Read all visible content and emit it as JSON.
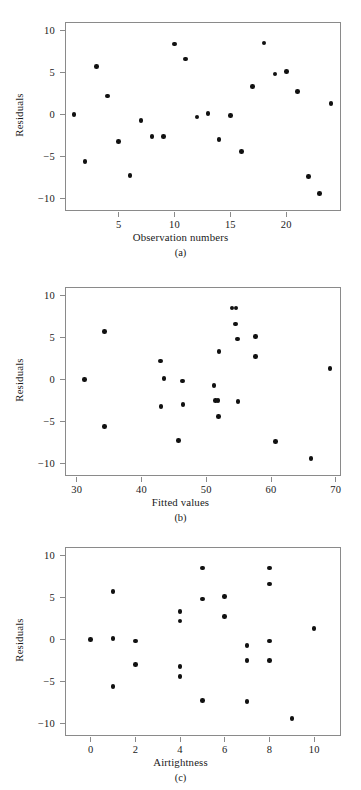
{
  "figure": {
    "ylabel": "Residuals",
    "yticks": [
      "10",
      "5",
      "0",
      "-5",
      "-10"
    ],
    "ytick_values": [
      10,
      5,
      0,
      -5,
      -10
    ],
    "ylim": [
      -11.5,
      11.0
    ]
  },
  "chart_data": [
    {
      "type": "scatter",
      "panel": "(a)",
      "title": "",
      "xlabel": "Observation numbers",
      "ylabel": "Residuals",
      "xticks": [
        "5",
        "10",
        "15",
        "20"
      ],
      "xtick_values": [
        5,
        10,
        15,
        20
      ],
      "xlim": [
        0.2,
        24.9
      ],
      "ylim": [
        -11.5,
        11.0
      ],
      "grid": false,
      "legend": "none",
      "x": [
        1,
        2,
        3,
        4,
        5,
        6,
        7,
        8,
        9,
        10,
        11,
        12,
        13,
        14,
        15,
        16,
        17,
        18,
        19,
        20,
        21,
        22,
        23,
        24
      ],
      "y": [
        0.0,
        -5.6,
        5.7,
        2.2,
        -3.2,
        -7.3,
        -0.7,
        -2.6,
        -2.6,
        8.4,
        6.6,
        -0.3,
        0.1,
        -3.0,
        -0.1,
        -4.4,
        3.3,
        8.5,
        4.8,
        5.1,
        2.7,
        -7.4,
        -9.4,
        1.3
      ]
    },
    {
      "type": "scatter",
      "panel": "(b)",
      "title": "",
      "xlabel": "Fitted values",
      "ylabel": "Residuals",
      "xticks": [
        "30",
        "40",
        "50",
        "60",
        "70"
      ],
      "xtick_values": [
        30,
        40,
        50,
        60,
        70
      ],
      "xlim": [
        28.2,
        70.8
      ],
      "ylim": [
        -11.5,
        11.0
      ],
      "grid": false,
      "legend": "none",
      "x": [
        31.2,
        34.3,
        34.3,
        42.9,
        43.5,
        45.7,
        43.0,
        46.3,
        46.4,
        54.0,
        54.6,
        51.2,
        51.4,
        51.9,
        54.5,
        52.0,
        51.8,
        54.8,
        54.9,
        57.6,
        57.6,
        60.7,
        66.2,
        69.1
      ],
      "y": [
        0.0,
        -5.6,
        5.7,
        2.2,
        0.1,
        -7.3,
        -3.2,
        -0.2,
        -3.0,
        8.5,
        8.5,
        -0.7,
        -2.5,
        -4.4,
        6.6,
        3.3,
        -2.5,
        4.8,
        -2.6,
        5.1,
        2.7,
        -7.4,
        -9.4,
        1.3
      ]
    },
    {
      "type": "scatter",
      "panel": "(c)",
      "title": "",
      "xlabel": "Airtightness",
      "ylabel": "Residuals",
      "xticks": [
        "0",
        "2",
        "4",
        "6",
        "8",
        "10"
      ],
      "xtick_values": [
        0,
        2,
        4,
        6,
        8,
        10
      ],
      "xlim": [
        -1.15,
        11.2
      ],
      "ylim": [
        -11.5,
        11.0
      ],
      "grid": false,
      "legend": "none",
      "x": [
        0,
        1,
        1,
        1,
        2,
        2,
        4,
        4,
        4,
        4,
        5,
        5,
        5,
        6,
        6,
        7,
        7,
        7,
        8,
        8,
        8,
        8,
        9,
        10
      ],
      "y": [
        0.0,
        0.1,
        5.7,
        -5.6,
        -0.2,
        -3.0,
        3.3,
        2.2,
        -3.2,
        -4.4,
        8.5,
        4.8,
        -7.3,
        5.1,
        2.7,
        -0.7,
        -2.5,
        -7.4,
        8.5,
        6.6,
        -2.5,
        -0.2,
        -9.4,
        1.3
      ]
    }
  ]
}
